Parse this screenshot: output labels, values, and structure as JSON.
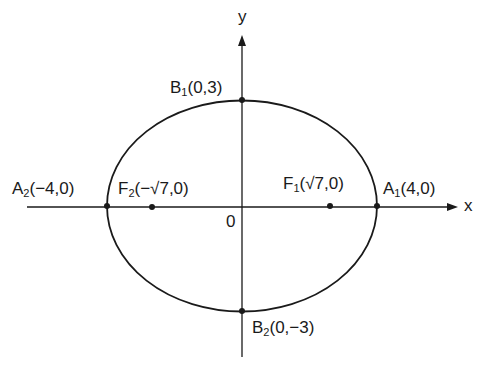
{
  "diagram": {
    "type": "ellipse",
    "equation_params": {
      "a": 4,
      "b": 3,
      "c": "√7"
    },
    "axes": {
      "x_label": "x",
      "y_label": "y",
      "origin_label": "0"
    },
    "points": {
      "A1": {
        "name": "A",
        "sub": "1",
        "coords": "(4,0)"
      },
      "A2": {
        "name": "A",
        "sub": "2",
        "coords": "(−4,0)"
      },
      "B1": {
        "name": "B",
        "sub": "1",
        "coords": "(0,3)"
      },
      "B2": {
        "name": "B",
        "sub": "2",
        "coords": "(0,−3)"
      },
      "F1": {
        "name": "F",
        "sub": "1",
        "coords": "(√7,0)"
      },
      "F2": {
        "name": "F",
        "sub": "2",
        "coords": "(−√7,0)"
      }
    },
    "colors": {
      "stroke": "#1a1a1a",
      "background": "#ffffff"
    }
  }
}
